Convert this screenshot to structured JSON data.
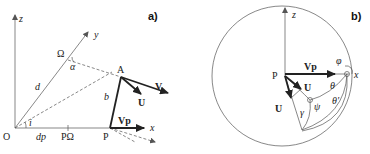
{
  "figure": {
    "panel_a": {
      "label": "a)",
      "axes": {
        "z": "z",
        "y": "y",
        "x": "x"
      },
      "points": {
        "origin": "O",
        "omega": "Ω",
        "A": "A",
        "P": "P",
        "P_omega": "PΩ"
      },
      "lengths": {
        "d": "d",
        "b": "b",
        "d_p": "dp"
      },
      "angles": {
        "alpha": "α",
        "i": "i"
      },
      "vectors": {
        "V": "V",
        "U": "U",
        "Vp": "Vp"
      }
    },
    "panel_b": {
      "label": "b)",
      "axes": {
        "z": "z",
        "x": "x"
      },
      "points": {
        "P": "P"
      },
      "angles": {
        "phi": "φ",
        "theta": "θ",
        "theta_prime": "θ'",
        "psi": "ψ",
        "gamma": "γ"
      },
      "vectors": {
        "Vp": "Vp",
        "U1": "U",
        "U2": "U"
      }
    }
  }
}
